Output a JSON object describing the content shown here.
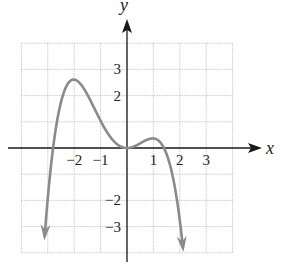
{
  "chart_data": {
    "type": "line",
    "title": "",
    "xlabel": "x",
    "ylabel": "y",
    "xlim": [
      -4,
      4
    ],
    "ylim": [
      -4,
      4
    ],
    "grid": true,
    "x_tick_labels": [
      {
        "value": -2,
        "label": "−2"
      },
      {
        "value": -1,
        "label": "−1"
      },
      {
        "value": 1,
        "label": "1"
      },
      {
        "value": 2,
        "label": "2"
      },
      {
        "value": 3,
        "label": "3"
      }
    ],
    "y_tick_labels": [
      {
        "value": 3,
        "label": "3"
      },
      {
        "value": 2,
        "label": "2"
      },
      {
        "value": -2,
        "label": "−2"
      },
      {
        "value": -3,
        "label": "−3"
      }
    ],
    "series": [
      {
        "name": "polynomial",
        "description": "Degree-4 polynomial, falls to -infinity at both ends; zeros near x=-2.8, x=0 (touches), x=1.4",
        "x": [
          -3.1,
          -2.8,
          -2.5,
          -2.0,
          -1.5,
          -1.0,
          -0.5,
          0.0,
          0.5,
          1.0,
          1.4,
          1.7,
          2.05
        ],
        "y": [
          -3.9,
          0.0,
          1.6,
          2.6,
          2.0,
          1.0,
          0.3,
          0.0,
          0.15,
          0.4,
          0.0,
          -1.4,
          -3.9
        ],
        "end_arrows": true
      }
    ],
    "key_points": [
      {
        "label": "local max",
        "x": -2,
        "y": 2.6
      },
      {
        "label": "local min",
        "x": 0,
        "y": 0
      },
      {
        "label": "local max",
        "x": 1,
        "y": 0.4
      }
    ]
  },
  "colors": {
    "curve": "#8a8a8a",
    "axes": "#1a1a1a",
    "grid": "#bdbdbd"
  }
}
